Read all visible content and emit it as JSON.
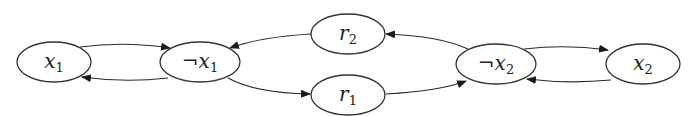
{
  "diagram": {
    "type": "directed-graph",
    "nodes": [
      {
        "id": "x1",
        "neg": "",
        "var": "x",
        "sub": "1",
        "cx": 54,
        "cy": 62,
        "rx": 37,
        "ry": 20
      },
      {
        "id": "not_x1",
        "neg": "¬",
        "var": "x",
        "sub": "1",
        "cx": 200,
        "cy": 62,
        "rx": 40,
        "ry": 20
      },
      {
        "id": "r2",
        "neg": "",
        "var": "r",
        "sub": "2",
        "cx": 348,
        "cy": 34,
        "rx": 37,
        "ry": 20
      },
      {
        "id": "r1",
        "neg": "",
        "var": "r",
        "sub": "1",
        "cx": 348,
        "cy": 95,
        "rx": 37,
        "ry": 20
      },
      {
        "id": "not_x2",
        "neg": "¬",
        "var": "x",
        "sub": "2",
        "cx": 496,
        "cy": 64,
        "rx": 40,
        "ry": 20
      },
      {
        "id": "x2",
        "neg": "",
        "var": "x",
        "sub": "2",
        "cx": 643,
        "cy": 64,
        "rx": 37,
        "ry": 20
      }
    ],
    "edges": [
      {
        "from": "x1",
        "to": "not_x1",
        "d": "M 80 47 Q 125 41 170 48"
      },
      {
        "from": "not_x1",
        "to": "x1",
        "d": "M 168 78 Q 125 83 82 77"
      },
      {
        "from": "r2",
        "to": "not_x1",
        "d": "M 311 34 Q 260 37 230 48"
      },
      {
        "from": "not_x2",
        "to": "r2",
        "d": "M 468 49 Q 440 36 386 34"
      },
      {
        "from": "not_x1",
        "to": "r1",
        "d": "M 228 78 Q 255 93 310 94"
      },
      {
        "from": "r1",
        "to": "not_x2",
        "d": "M 386 94 Q 440 91 466 81"
      },
      {
        "from": "not_x2",
        "to": "x2",
        "d": "M 524 49 Q 566 44 608 50"
      },
      {
        "from": "x2",
        "to": "not_x2",
        "d": "M 611 80 Q 568 84 527 79"
      }
    ]
  }
}
